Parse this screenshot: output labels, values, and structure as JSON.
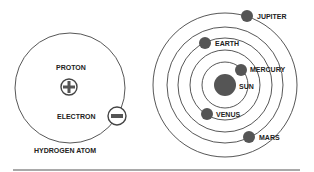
{
  "atom": {
    "caption": "HYDROGEN ATOM",
    "proton_label": "PROTON",
    "electron_label": "ELECTRON",
    "proton_symbol": "plus-icon",
    "electron_symbol": "minus-icon"
  },
  "solar_system": {
    "sun_label": "SUN",
    "planets": [
      {
        "name": "MERCURY"
      },
      {
        "name": "VENUS"
      },
      {
        "name": "EARTH"
      },
      {
        "name": "MARS"
      },
      {
        "name": "JUPITER"
      }
    ]
  },
  "colors": {
    "ink": "#222222",
    "body": "#555555"
  }
}
